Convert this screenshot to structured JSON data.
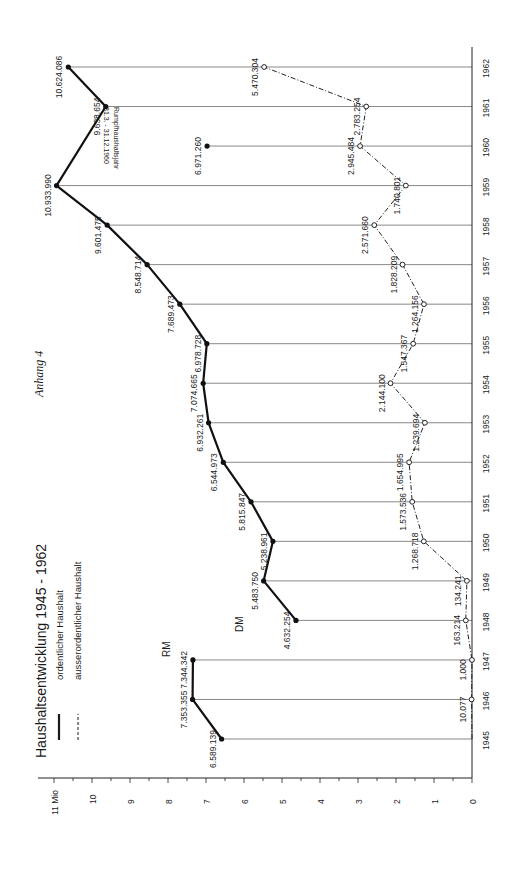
{
  "page_label": "Anhang 4",
  "chart_data": {
    "type": "line",
    "title": "Haushaltsentwicklung 1945 - 1962",
    "orientation": "rotated-90-ccw",
    "xlabel": "",
    "ylabel": "Mio",
    "y_unit_label": "11 Mio",
    "ylim": [
      0,
      11
    ],
    "y_ticks": [
      "0",
      "1",
      "2",
      "3",
      "4",
      "5",
      "6",
      "7",
      "8",
      "9",
      "10",
      "11 Mio"
    ],
    "grid": "vertical lines at each year",
    "currency_labels": [
      {
        "text": "RM",
        "period": "1945-1947"
      },
      {
        "text": "DM",
        "period": "1948-1962"
      }
    ],
    "annotation": {
      "text_line1": "Rumpfhaushaltsjahr",
      "text_line2": "31.3. - 31.12.1960",
      "year": 1960
    },
    "legend": [
      {
        "name": "ordentlicher Haushalt",
        "style": "solid"
      },
      {
        "name": "ausserordentlicher Haushalt",
        "style": "dashed"
      }
    ],
    "categories": [
      "1945",
      "1946",
      "1947",
      "1948",
      "1949",
      "1950",
      "1951",
      "1952",
      "1953",
      "1954",
      "1955",
      "1956",
      "1957",
      "1958",
      "1959",
      "1960",
      "1961",
      "1962"
    ],
    "series": [
      {
        "name": "ordentlicher Haushalt",
        "style": "solid",
        "values": [
          6589139,
          7353355,
          7344342,
          4632254,
          5483750,
          5238961,
          5815847,
          6544973,
          6932261,
          7074665,
          6978728,
          7689473,
          8548714,
          9601475,
          10933990,
          6971260,
          9638654,
          10624086
        ],
        "labels": [
          "6.589.139",
          "7.353.355",
          "7.344.342",
          "4.632.254",
          "5.483.750",
          "5.238.961",
          "5.815.847",
          "6.544.973",
          "6.932.261",
          "7.074.665",
          "6.978.728",
          "7.689.473",
          "8.548.714",
          "9.601.475",
          "10.933.990",
          "6.971.260",
          "9.638.654",
          "10.624.086"
        ]
      },
      {
        "name": "ausserordentlicher Haushalt",
        "style": "dashed",
        "values": [
          0,
          10077,
          1000,
          163214,
          134241,
          1268718,
          1573536,
          1654995,
          1239694,
          2144100,
          1547367,
          1264156,
          1828209,
          2571660,
          1740801,
          2945484,
          2783254,
          5470304
        ],
        "labels": [
          "",
          "10.077",
          "1.000",
          "163.214",
          "134.241",
          "1.268.718",
          "1.573.536",
          "1.654.995",
          "1.239.694",
          "2.144.100",
          "1.547.367",
          "1.264.156",
          "1.828.209",
          "2.571.660",
          "1.740.801",
          "2.945.484",
          "2.783.254",
          "5.470.304"
        ]
      }
    ]
  }
}
